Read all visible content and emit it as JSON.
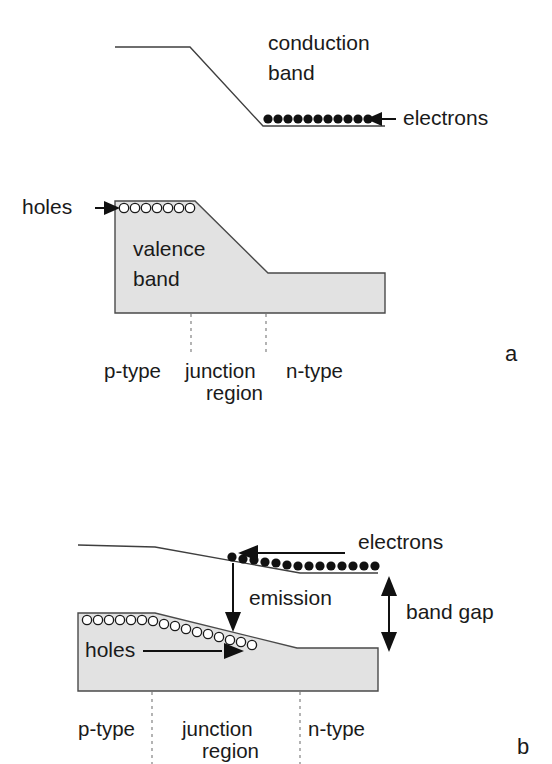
{
  "figure": {
    "title_visible": false,
    "background_color": "#ffffff",
    "band_fill_color": "#e2e2e2",
    "band_stroke_color": "#4a4a4a",
    "ink_color": "#1a1a1a",
    "panels": [
      {
        "letter": "a",
        "letter_pos": {
          "x": 508,
          "y": 355
        },
        "description_visible": false,
        "labels": {
          "conduction_band_line1": "conduction",
          "conduction_band_line2": "band",
          "valence_band_line1": "valence",
          "valence_band_line2": "band",
          "electrons": "electrons",
          "holes": "holes",
          "p_type": "p-type",
          "junction_line1": "junction",
          "junction_line2": "region",
          "n_type": "n-type"
        },
        "carriers": {
          "electron_count": 11,
          "electron_symbol": "filled-circle",
          "hole_count": 7,
          "hole_symbol": "open-circle"
        },
        "arrows": {
          "electrons_direction": "left",
          "holes_direction": "right"
        }
      },
      {
        "letter": "b",
        "letter_pos": {
          "x": 520,
          "y": 748
        },
        "description_visible": false,
        "labels": {
          "electrons": "electrons",
          "holes": "holes",
          "emission": "emission",
          "band_gap": "band gap",
          "p_type": "p-type",
          "junction_line1": "junction",
          "junction_line2": "region",
          "n_type": "n-type"
        },
        "carriers": {
          "electron_count": 17,
          "electron_symbol": "filled-circle",
          "hole_count": 17,
          "hole_symbol": "open-circle"
        },
        "arrows": {
          "electrons_direction": "left",
          "holes_direction": "right",
          "emission_direction": "down",
          "band_gap_direction": "double-vertical"
        }
      }
    ]
  }
}
